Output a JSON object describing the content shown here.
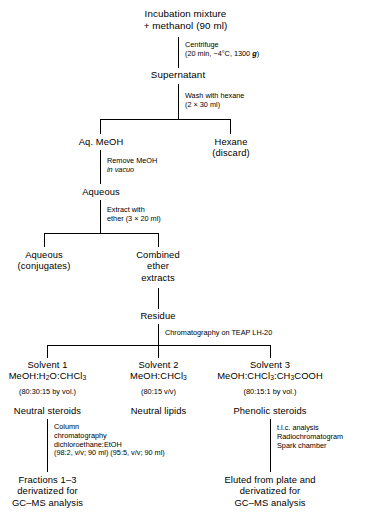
{
  "diagram": {
    "line_color": "#000000",
    "background": "#ffffff",
    "nodes": {
      "start": "Incubation mixture\n+ methanol (90 ml)",
      "start_line1": "Incubation mixture",
      "start_line2": "+ methanol (90 ml)",
      "supernatant": "Supernatant",
      "aq_meoh": "Aq. MeOH",
      "hexane_line1": "Hexane",
      "hexane_line2": "(discard)",
      "aqueous": "Aqueous",
      "aqueous_conj_line1": "Aqueous",
      "aqueous_conj_line2": "(conjugates)",
      "combined_line1": "Combined",
      "combined_line2": "ether",
      "combined_line3": "extracts",
      "residue": "Residue",
      "solvent1_name": "Solvent 1",
      "solvent1_formula_pre": "MeOH:H",
      "solvent1_formula_sub1": "2",
      "solvent1_formula_mid": "O:CHCl",
      "solvent1_formula_sub2": "3",
      "solvent1_ratio": "(80:30:15 by vol.)",
      "solvent1_product": "Neutral steroids",
      "solvent2_name": "Solvent 2",
      "solvent2_formula_pre": "MeOH:CHCl",
      "solvent2_formula_sub": "3",
      "solvent2_ratio": "(80:15 v/v)",
      "solvent2_product": "Neutral lipids",
      "solvent3_name": "Solvent 3",
      "solvent3_formula_pre": "MeOH:CHCl",
      "solvent3_formula_sub1": "3",
      "solvent3_formula_mid": ":CH",
      "solvent3_formula_sub2": "3",
      "solvent3_formula_post": "COOH",
      "solvent3_ratio": "(80:15:1 by vol.)",
      "solvent3_product": "Phenolic steroids",
      "end_left_line1": "Fractions 1–3",
      "end_left_line2": "derivatized for",
      "end_left_line3": "GC–MS analysis",
      "end_right_line1": "Eluted from plate and",
      "end_right_line2": "derivatized for",
      "end_right_line3": "GC–MS analysis"
    },
    "annotations": {
      "centrifuge_line1": "Centrifuge",
      "centrifuge_line2_pre": "(20 min, −4°C, 1300 ",
      "centrifuge_line2_g": "g",
      "centrifuge_line2_post": ")",
      "wash_line1": "Wash with hexane",
      "wash_line2": "(2 × 30 ml)",
      "remove_line1": "Remove MeOH",
      "remove_line2": "in vacuo",
      "extract_line1": "Extract with",
      "extract_line2": "ether (3 × 20 ml)",
      "chromatography": "Chromatography on TEAP LH-20",
      "column_line1": "Column",
      "column_line2": "chromatography",
      "column_line3": "dichloroethane:EtOH",
      "column_line4": "(98:2, v/v; 90 ml) (95:5, v/v; 90 ml)",
      "tlc_line1": "t.l.c. analysis",
      "tlc_line2": "Radiochromatogram",
      "tlc_line3": "Spark chamber"
    }
  }
}
